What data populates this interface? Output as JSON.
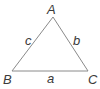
{
  "diagram": {
    "type": "triangle",
    "stroke_color": "#8a8a8a",
    "label_color": "#3a3a3a",
    "vertices": [
      {
        "label": "A",
        "x": 53,
        "y": 17
      },
      {
        "label": "B",
        "x": 12,
        "y": 71
      },
      {
        "label": "C",
        "x": 88,
        "y": 71
      }
    ],
    "sides": [
      {
        "label": "a",
        "between": "B-C"
      },
      {
        "label": "b",
        "between": "A-C"
      },
      {
        "label": "c",
        "between": "A-B"
      }
    ]
  }
}
